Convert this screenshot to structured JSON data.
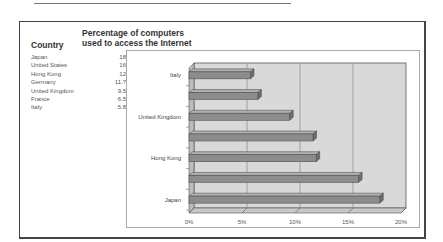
{
  "header": {
    "country_label": "Country",
    "value_label_line1": "Percentage of computers",
    "value_label_line2": "used to access the Internet"
  },
  "table": {
    "rows": [
      {
        "country": "Japan",
        "value": "18"
      },
      {
        "country": "United States",
        "value": "16"
      },
      {
        "country": "Hong Kong",
        "value": "12"
      },
      {
        "country": "Germany",
        "value": "11.7"
      },
      {
        "country": "United Kingdom",
        "value": "9.5"
      },
      {
        "country": "France",
        "value": "6.5"
      },
      {
        "country": "Italy",
        "value": "5.8"
      }
    ]
  },
  "chart_data": {
    "type": "bar",
    "orientation": "horizontal",
    "style": "3d",
    "title": "Percentage of computers used to access the Internet",
    "categories": [
      "Japan",
      "United States",
      "Hong Kong",
      "Germany",
      "United Kingdom",
      "France",
      "Italy"
    ],
    "values": [
      18,
      16,
      12,
      11.7,
      9.5,
      6.5,
      5.8
    ],
    "visible_category_labels": [
      "Italy",
      "United Kingdom",
      "Hong Kong",
      "Japan"
    ],
    "x_ticks": [
      "0%",
      "5%",
      "10%",
      "15%",
      "20%"
    ],
    "xlim": [
      0,
      20
    ],
    "xlabel": "",
    "ylabel": "",
    "grid": true,
    "legend": "none",
    "colors": {
      "bar": "#8c8c8c",
      "bar_top": "#b0b0b0",
      "wall": "#d9d9d9",
      "grid": "#888888"
    }
  }
}
